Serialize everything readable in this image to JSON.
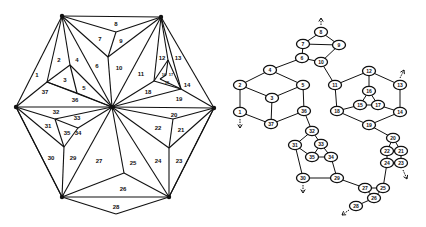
{
  "left_diagram": {
    "title": "Triangulated hexagon",
    "vertices": {
      "TL": [
        62,
        16
      ],
      "TR": [
        161,
        17
      ],
      "L": [
        16,
        107
      ],
      "C": [
        112,
        107
      ],
      "R": [
        214,
        108
      ],
      "BL": [
        62,
        197
      ],
      "BR": [
        169,
        197
      ],
      "B": [
        116,
        214
      ],
      "p8": [
        116,
        32
      ],
      "p10": [
        108,
        57
      ],
      "p2": [
        70,
        65
      ],
      "p1": [
        47,
        82
      ],
      "p3": [
        77,
        93
      ],
      "p12": [
        168,
        60
      ],
      "p11": [
        154,
        81
      ],
      "p14": [
        181,
        89
      ],
      "p16": [
        166,
        75
      ],
      "p15": [
        160,
        79
      ],
      "p20": [
        173,
        119
      ],
      "p22": [
        169,
        148
      ],
      "p25": [
        124,
        173
      ],
      "p31": [
        55,
        119
      ],
      "p33": [
        78,
        128
      ],
      "p29": [
        64,
        147
      ]
    },
    "edges": [
      [
        "TL",
        "TR"
      ],
      [
        "TR",
        "R"
      ],
      [
        "R",
        "BR"
      ],
      [
        "BR",
        "B"
      ],
      [
        "B",
        "BL"
      ],
      [
        "BL",
        "L"
      ],
      [
        "L",
        "TL"
      ],
      [
        "TL",
        "p8"
      ],
      [
        "p8",
        "TR"
      ],
      [
        "p8",
        "p10"
      ],
      [
        "TL",
        "p10"
      ],
      [
        "TR",
        "p10"
      ],
      [
        "p10",
        "C"
      ],
      [
        "TR",
        "C"
      ],
      [
        "TL",
        "C"
      ],
      [
        "TL",
        "p2"
      ],
      [
        "p2",
        "C"
      ],
      [
        "TL",
        "p1"
      ],
      [
        "p1",
        "L"
      ],
      [
        "p1",
        "p2"
      ],
      [
        "p2",
        "p3"
      ],
      [
        "p1",
        "p3"
      ],
      [
        "p3",
        "C"
      ],
      [
        "p1",
        "C"
      ],
      [
        "L",
        "C"
      ],
      [
        "TR",
        "p12"
      ],
      [
        "TR",
        "p11"
      ],
      [
        "TR",
        "p14"
      ],
      [
        "p12",
        "p11"
      ],
      [
        "p12",
        "p14"
      ],
      [
        "p11",
        "p14"
      ],
      [
        "p11",
        "C"
      ],
      [
        "p14",
        "C"
      ],
      [
        "p14",
        "R"
      ],
      [
        "p16",
        "p15"
      ],
      [
        "p15",
        "p14"
      ],
      [
        "p12",
        "p16"
      ],
      [
        "C",
        "R"
      ],
      [
        "C",
        "p20"
      ],
      [
        "p20",
        "R"
      ],
      [
        "p20",
        "p22"
      ],
      [
        "C",
        "p22"
      ],
      [
        "p22",
        "R"
      ],
      [
        "p22",
        "BR"
      ],
      [
        "C",
        "BR"
      ],
      [
        "R",
        "BR"
      ],
      [
        "C",
        "p25"
      ],
      [
        "p25",
        "BR"
      ],
      [
        "p25",
        "BL"
      ],
      [
        "BL",
        "BR"
      ],
      [
        "C",
        "BL"
      ],
      [
        "L",
        "p31"
      ],
      [
        "p31",
        "C"
      ],
      [
        "p31",
        "p29"
      ],
      [
        "L",
        "p29"
      ],
      [
        "p29",
        "BL"
      ],
      [
        "p31",
        "p33"
      ],
      [
        "p33",
        "C"
      ],
      [
        "p33",
        "p29"
      ],
      [
        "L",
        "BL"
      ]
    ],
    "hubs": [
      "TL",
      "TR",
      "L",
      "C",
      "R",
      "BL",
      "BR"
    ],
    "labels": [
      {
        "t": "1",
        "x": 37,
        "y": 75
      },
      {
        "t": "2",
        "x": 59,
        "y": 60
      },
      {
        "t": "3",
        "x": 65,
        "y": 80
      },
      {
        "t": "4",
        "x": 77,
        "y": 60
      },
      {
        "t": "5",
        "x": 84,
        "y": 88
      },
      {
        "t": "6",
        "x": 97,
        "y": 66
      },
      {
        "t": "7",
        "x": 100,
        "y": 39
      },
      {
        "t": "8",
        "x": 116,
        "y": 24
      },
      {
        "t": "9",
        "x": 121,
        "y": 41
      },
      {
        "t": "10",
        "x": 119,
        "y": 68
      },
      {
        "t": "11",
        "x": 141,
        "y": 74
      },
      {
        "t": "12",
        "x": 162,
        "y": 58
      },
      {
        "t": "13",
        "x": 178,
        "y": 58
      },
      {
        "t": "14",
        "x": 187,
        "y": 85
      },
      {
        "t": "15",
        "x": 167,
        "y": 82,
        "small": true
      },
      {
        "t": "16",
        "x": 164,
        "y": 74,
        "small": true
      },
      {
        "t": "17",
        "x": 171,
        "y": 74,
        "small": true
      },
      {
        "t": "18",
        "x": 148,
        "y": 92
      },
      {
        "t": "19",
        "x": 179,
        "y": 99
      },
      {
        "t": "20",
        "x": 174,
        "y": 115
      },
      {
        "t": "21",
        "x": 181,
        "y": 130
      },
      {
        "t": "22",
        "x": 158,
        "y": 128
      },
      {
        "t": "23",
        "x": 179,
        "y": 161
      },
      {
        "t": "24",
        "x": 158,
        "y": 161
      },
      {
        "t": "25",
        "x": 133,
        "y": 163
      },
      {
        "t": "26",
        "x": 123,
        "y": 189
      },
      {
        "t": "27",
        "x": 99,
        "y": 161
      },
      {
        "t": "28",
        "x": 116,
        "y": 207
      },
      {
        "t": "29",
        "x": 73,
        "y": 158
      },
      {
        "t": "30",
        "x": 51,
        "y": 158
      },
      {
        "t": "31",
        "x": 48,
        "y": 126
      },
      {
        "t": "32",
        "x": 56,
        "y": 112
      },
      {
        "t": "33",
        "x": 77,
        "y": 118
      },
      {
        "t": "34",
        "x": 78,
        "y": 133
      },
      {
        "t": "35",
        "x": 67,
        "y": 133
      },
      {
        "t": "36",
        "x": 75,
        "y": 100
      },
      {
        "t": "37",
        "x": 45,
        "y": 92
      }
    ]
  },
  "right_diagram": {
    "title": "Adjacency graph",
    "nodes": [
      {
        "id": "8",
        "x": 321,
        "y": 32
      },
      {
        "id": "7",
        "x": 303,
        "y": 44
      },
      {
        "id": "9",
        "x": 339,
        "y": 45
      },
      {
        "id": "6",
        "x": 302,
        "y": 58
      },
      {
        "id": "10",
        "x": 321,
        "y": 62
      },
      {
        "id": "4",
        "x": 270,
        "y": 70
      },
      {
        "id": "2",
        "x": 240,
        "y": 85
      },
      {
        "id": "5",
        "x": 303,
        "y": 85
      },
      {
        "id": "3",
        "x": 272,
        "y": 98
      },
      {
        "id": "1",
        "x": 240,
        "y": 112
      },
      {
        "id": "37",
        "x": 271,
        "y": 124
      },
      {
        "id": "36",
        "x": 304,
        "y": 111
      },
      {
        "id": "11",
        "x": 335,
        "y": 85
      },
      {
        "id": "12",
        "x": 369,
        "y": 71
      },
      {
        "id": "13",
        "x": 400,
        "y": 85
      },
      {
        "id": "16",
        "x": 369,
        "y": 91
      },
      {
        "id": "15",
        "x": 360,
        "y": 105
      },
      {
        "id": "17",
        "x": 378,
        "y": 105
      },
      {
        "id": "18",
        "x": 337,
        "y": 111
      },
      {
        "id": "14",
        "x": 400,
        "y": 112
      },
      {
        "id": "19",
        "x": 369,
        "y": 125
      },
      {
        "id": "20",
        "x": 393,
        "y": 138
      },
      {
        "id": "22",
        "x": 387,
        "y": 151
      },
      {
        "id": "21",
        "x": 401,
        "y": 151
      },
      {
        "id": "24",
        "x": 387,
        "y": 163
      },
      {
        "id": "23",
        "x": 401,
        "y": 163
      },
      {
        "id": "32",
        "x": 312,
        "y": 131
      },
      {
        "id": "31",
        "x": 295,
        "y": 145
      },
      {
        "id": "33",
        "x": 321,
        "y": 144
      },
      {
        "id": "35",
        "x": 312,
        "y": 157
      },
      {
        "id": "34",
        "x": 331,
        "y": 157
      },
      {
        "id": "30",
        "x": 303,
        "y": 178
      },
      {
        "id": "29",
        "x": 337,
        "y": 178
      },
      {
        "id": "27",
        "x": 365,
        "y": 188
      },
      {
        "id": "25",
        "x": 383,
        "y": 188
      },
      {
        "id": "26",
        "x": 374,
        "y": 198
      },
      {
        "id": "28",
        "x": 356,
        "y": 206
      }
    ],
    "edges": [
      [
        "8",
        "7"
      ],
      [
        "8",
        "9"
      ],
      [
        "7",
        "9"
      ],
      [
        "7",
        "6"
      ],
      [
        "9",
        "10"
      ],
      [
        "6",
        "10"
      ],
      [
        "6",
        "4"
      ],
      [
        "10",
        "11"
      ],
      [
        "4",
        "2"
      ],
      [
        "4",
        "5"
      ],
      [
        "2",
        "3"
      ],
      [
        "5",
        "3"
      ],
      [
        "2",
        "1"
      ],
      [
        "3",
        "37"
      ],
      [
        "1",
        "37"
      ],
      [
        "5",
        "36"
      ],
      [
        "37",
        "36"
      ],
      [
        "11",
        "12"
      ],
      [
        "11",
        "18"
      ],
      [
        "12",
        "13"
      ],
      [
        "12",
        "16"
      ],
      [
        "16",
        "15"
      ],
      [
        "16",
        "17"
      ],
      [
        "15",
        "17"
      ],
      [
        "15",
        "18"
      ],
      [
        "17",
        "14"
      ],
      [
        "13",
        "14"
      ],
      [
        "18",
        "19"
      ],
      [
        "14",
        "19"
      ],
      [
        "19",
        "20"
      ],
      [
        "20",
        "22"
      ],
      [
        "20",
        "21"
      ],
      [
        "22",
        "21"
      ],
      [
        "22",
        "24"
      ],
      [
        "21",
        "23"
      ],
      [
        "24",
        "25"
      ],
      [
        "36",
        "32"
      ],
      [
        "32",
        "31"
      ],
      [
        "32",
        "33"
      ],
      [
        "31",
        "35"
      ],
      [
        "33",
        "35"
      ],
      [
        "33",
        "34"
      ],
      [
        "35",
        "34"
      ],
      [
        "31",
        "30"
      ],
      [
        "34",
        "29"
      ],
      [
        "30",
        "29"
      ],
      [
        "29",
        "27"
      ],
      [
        "27",
        "25"
      ],
      [
        "27",
        "26"
      ],
      [
        "25",
        "26"
      ],
      [
        "26",
        "28"
      ]
    ],
    "arrows": [
      {
        "id": "arrow-up-8",
        "x1": 321,
        "y1": 25,
        "x2": 321,
        "y2": 18
      },
      {
        "id": "arrow-down-1",
        "x1": 240,
        "y1": 119,
        "x2": 240,
        "y2": 128
      },
      {
        "id": "arrow-up-13",
        "x1": 400,
        "y1": 78,
        "x2": 404,
        "y2": 70
      },
      {
        "id": "arrow-down-30",
        "x1": 303,
        "y1": 185,
        "x2": 303,
        "y2": 193
      },
      {
        "id": "arrow-down-23",
        "x1": 403,
        "y1": 170,
        "x2": 407,
        "y2": 179
      },
      {
        "id": "arrow-left-28",
        "x1": 349,
        "y1": 210,
        "x2": 342,
        "y2": 215
      }
    ]
  }
}
